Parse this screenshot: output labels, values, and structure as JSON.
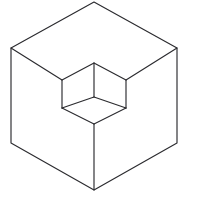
{
  "figure": {
    "subtitle": "Isometric line drawing optical illusion",
    "background_color": "#ffffff",
    "line_color": "#2b2b2f",
    "line_width": 1.15,
    "canvas": {
      "width": 217,
      "height": 198
    },
    "vertices": {
      "outer_top_apex": {
        "x": 94,
        "y": 2
      },
      "outer_upper_left": {
        "x": 11,
        "y": 48
      },
      "outer_upper_right": {
        "x": 177,
        "y": 48
      },
      "outer_lower_left": {
        "x": 11,
        "y": 143
      },
      "outer_lower_right": {
        "x": 177,
        "y": 143
      },
      "outer_bottom_apex": {
        "x": 94,
        "y": 190
      },
      "notch_top_apex": {
        "x": 94,
        "y": 63
      },
      "notch_left": {
        "x": 62,
        "y": 80
      },
      "notch_right": {
        "x": 126,
        "y": 80
      },
      "notch_center": {
        "x": 94,
        "y": 97
      },
      "notch_lower_left": {
        "x": 62,
        "y": 108
      },
      "notch_lower_right": {
        "x": 126,
        "y": 108
      },
      "notch_bottom_apex": {
        "x": 94,
        "y": 124
      }
    },
    "paths": {
      "outer_hexagon_outline": "M 94 2 L 177 48 L 177 143 L 94 190 L 11 143 L 11 48 Z",
      "left_face_fill": "M 11 48 L 94 97 L 94 190 L 11 143 Z",
      "right_face_fill": "M 177 48 L 177 143 L 94 190 L 94 97 Z",
      "top_face_fill": "M 94 2 L 177 48 L 94 97 L 11 48 Z",
      "top_face_left_diagonal": "M 11 48 L 62 80",
      "top_face_right_diagonal": "M 177 48 L 126 80",
      "notch_top_left_edge": "M 62 80 L 94 63",
      "notch_top_right_edge": "M 94 63 L 126 80",
      "notch_vertical_center": "M 94 63 L 94 97",
      "notch_left_vertical": "M 62 80 L 62 108",
      "notch_right_vertical": "M 126 80 L 126 108",
      "notch_floor_left_edge": "M 62 108 L 94 124",
      "notch_floor_right_edge": "M 126 108 L 94 124",
      "notch_inner_left_edge": "M 62 108 L 94 97",
      "notch_inner_right_edge": "M 126 108 L 94 97",
      "body_vertical_edge": "M 94 124 L 94 190"
    },
    "edge_labels": {
      "outer_outline": "outer cube silhouette",
      "top_face_left_diagonal": "top face left receding edge",
      "top_face_right_diagonal": "top face right receding edge",
      "notch_top_left_edge": "notch top-left rim",
      "notch_top_right_edge": "notch top-right rim",
      "notch_vertical_center": "notch near vertical corner",
      "notch_left_vertical": "notch left wall corner",
      "notch_right_vertical": "notch right wall corner",
      "notch_floor_left_edge": "notch floor left edge",
      "notch_floor_right_edge": "notch floor right edge",
      "notch_inner_left_edge": "notch inner left edge",
      "notch_inner_right_edge": "notch inner right edge",
      "body_vertical_edge": "front vertical body edge"
    }
  }
}
